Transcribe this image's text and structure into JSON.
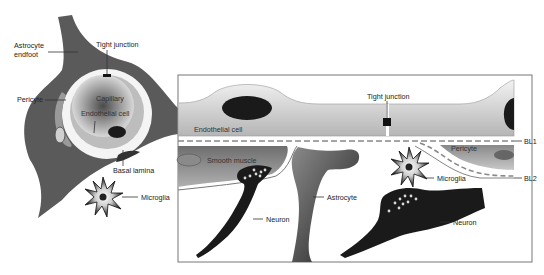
{
  "figure": {
    "left_panel": {
      "view": "capillary cross-section",
      "labels": {
        "astrocyte_endfoot_line1": "Astrocyte",
        "astrocyte_endfoot_line2": "endfoot",
        "tight_junction": "Tight junction",
        "pericyte": "Pericyte",
        "capillary": "Capillary",
        "endothelial_cell": "Endothelial cell",
        "basal_lamina": "Basal lamina",
        "microglia": "Microglia"
      }
    },
    "right_panel": {
      "view": "longitudinal section (boxed detail)",
      "labels": {
        "endothelial_cell": "Endothelial cell",
        "tight_junction": "Tight junction",
        "bl1": "BL1",
        "bl2": "BL2",
        "smooth_muscle": "Smooth muscle",
        "pericyte": "Pericyte",
        "microglia": "Microglia",
        "astrocyte": "Astrocyte",
        "neuron_left": "Neuron",
        "neuron_right": "Neuron"
      }
    },
    "colors": {
      "dark_cell": "#1a1a1a",
      "astrocyte_gray": "#5a5a5a",
      "endothelium_light": "#d8d8d8",
      "box_border": "#777777",
      "text": "#222222"
    }
  }
}
